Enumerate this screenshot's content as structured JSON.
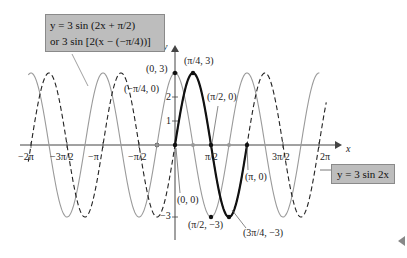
{
  "chart_data": {
    "type": "line",
    "title": "",
    "xlabel": "x",
    "ylabel": "y",
    "xlim": [
      -6.4,
      6.6
    ],
    "ylim": [
      -3.3,
      3.3
    ],
    "x_ticks": [
      "-2π",
      "-3π/2",
      "-π",
      "-π/2",
      "π/2",
      "3π/2",
      "2π"
    ],
    "y_ticks": [
      "-3",
      "1",
      "2",
      "3"
    ],
    "series": [
      {
        "name": "y = 3 sin 2x",
        "style": "solid-bold-black",
        "domain": [
          0,
          3.1416
        ],
        "formula": "3*sin(2x)"
      },
      {
        "name": "y = 3 sin 2x (extended)",
        "style": "dashed-black",
        "domain": [
          -6.4,
          6.6
        ],
        "formula": "3*sin(2x)"
      },
      {
        "name": "y = 3 sin (2x + π/2)",
        "style": "solid-gray",
        "domain": [
          -6.4,
          6.3
        ],
        "formula": "3*sin(2x+π/2)"
      }
    ],
    "points": [
      {
        "label": "(π/4, 3)",
        "x": 0.7854,
        "y": 3
      },
      {
        "label": "(0, 3)",
        "x": 0,
        "y": 3
      },
      {
        "label": "(−π/4, 0)",
        "x": -0.7854,
        "y": 0
      },
      {
        "label": "(π/2, 0)",
        "x": 1.5708,
        "y": 0
      },
      {
        "label": "(π, 0)",
        "x": 3.1416,
        "y": 0
      },
      {
        "label": "(0, 0)",
        "x": 0,
        "y": 0
      },
      {
        "label": "(π/2, −3)",
        "x": 1.5708,
        "y": -3
      },
      {
        "label": "(3π/4, −3)",
        "x": 2.3562,
        "y": -3
      }
    ],
    "annotations": [
      "y = 3 sin (2x + π/2) or 3 sin [2(x − (−π/4))]",
      "y = 3 sin 2x"
    ]
  },
  "labels": {
    "box1_line1": "y = 3 sin (2x + π/2)",
    "box1_line2": "or 3 sin [2(x − (−π/4))]",
    "box2": "y = 3 sin 2x",
    "axis_x": "x",
    "axis_y": "y",
    "tick_neg2pi": "−2π",
    "tick_neg3pi2": "−3π/2",
    "tick_negpi": "−π",
    "tick_negpi2": "−π/2",
    "tick_pi2": "π/2",
    "tick_3pi2": "3π/2",
    "tick_2pi": "2π",
    "ytick_3": "3",
    "ytick_2": "2",
    "ytick_1": "1",
    "ytick_neg3": "−3",
    "pt_pi4_3": "(π/4, 3)",
    "pt_0_3": "(0, 3)",
    "pt_negpi4_0": "(−π/4, 0)",
    "pt_pi2_0": "(π/2, 0)",
    "pt_pi_0": "(π, 0)",
    "pt_0_0": "(0, 0)",
    "pt_pi2_neg3": "(π/2, −3)",
    "pt_3pi4_neg3": "(3π/4, −3)"
  },
  "colors": {
    "black": "#111111",
    "gray": "#9a9a9a",
    "box": "#bdbdbd"
  }
}
